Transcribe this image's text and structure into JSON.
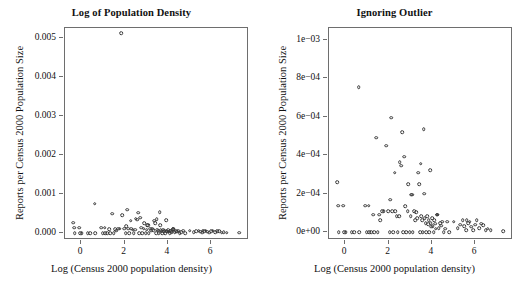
{
  "figure": {
    "shared_xlabel": "Log (Census 2000 population density)",
    "shared_ylabel": "Reports per Census 2000 Population Size",
    "point_color": "#3a3a3a",
    "axis_color": "#6e6e6e",
    "background": "#ffffff"
  },
  "chart_data": [
    {
      "type": "scatter",
      "title": "Log of Population Density",
      "xlabel": "Log (Census 2000 population density)",
      "ylabel": "Reports per Census 2000 Population Size",
      "xlim": [
        -0.75,
        7.75
      ],
      "ylim": [
        -0.00018,
        0.00525
      ],
      "xticks": [
        0,
        2,
        4,
        6
      ],
      "xticklabels": [
        "0",
        "2",
        "4",
        "6"
      ],
      "yticks": [
        0.0,
        0.001,
        0.002,
        0.003,
        0.004,
        0.005
      ],
      "yticklabels": [
        "0.000",
        "0.001",
        "0.002",
        "0.003",
        "0.004",
        "0.005"
      ],
      "grid": false,
      "legend": null,
      "marker": "open-circle",
      "n_points": 110,
      "x": [
        -0.38,
        -0.32,
        -0.3,
        -0.1,
        -0.05,
        0.02,
        0.3,
        0.42,
        0.62,
        0.65,
        0.92,
        1.0,
        1.08,
        1.12,
        1.2,
        1.28,
        1.35,
        1.42,
        1.5,
        1.58,
        1.62,
        1.7,
        1.78,
        1.85,
        1.9,
        1.98,
        2.05,
        2.08,
        2.12,
        2.18,
        2.22,
        2.28,
        2.32,
        2.38,
        2.42,
        2.48,
        2.52,
        2.58,
        2.62,
        2.68,
        2.72,
        2.78,
        2.82,
        2.88,
        2.92,
        2.98,
        3.02,
        3.05,
        3.08,
        3.12,
        3.18,
        3.22,
        3.28,
        3.32,
        3.38,
        3.42,
        3.45,
        3.48,
        3.52,
        3.55,
        3.58,
        3.62,
        3.65,
        3.68,
        3.72,
        3.75,
        3.78,
        3.82,
        3.85,
        3.88,
        3.92,
        3.95,
        3.98,
        4.02,
        4.05,
        4.08,
        4.12,
        4.15,
        4.18,
        4.22,
        4.25,
        4.28,
        4.32,
        4.38,
        4.42,
        4.48,
        4.55,
        4.62,
        4.72,
        4.8,
        5.02,
        5.2,
        5.32,
        5.42,
        5.5,
        5.58,
        5.62,
        5.68,
        5.75,
        5.82,
        5.9,
        6.0,
        6.08,
        6.18,
        6.28,
        6.38,
        6.48,
        6.58,
        6.72,
        7.3
      ],
      "y": [
        0.00026,
        0.000138,
        0.0,
        0.000138,
        0.0,
        0.0,
        0.0,
        0.0,
        0.000752,
        0.0,
        0.000138,
        0.0,
        0.000138,
        0.0,
        0.0,
        9.2e-05,
        0.0,
        0.00049,
        0.0,
        9.2e-05,
        6.2e-05,
        0.000108,
        0.000108,
        0.00511,
        0.00045,
        0.000108,
        0.0,
        0.00017,
        0.000595,
        0.000108,
        0.0,
        0.00031,
        0.000108,
        8.5e-05,
        0.0,
        8.2e-05,
        0.000365,
        0.000345,
        0.00052,
        0.0,
        0.000392,
        0.000135,
        0.0,
        0.000108,
        0.00025,
        0.0,
        8.5e-05,
        0.000195,
        0.000195,
        0.0,
        0.000108,
        6.2e-05,
        0.000105,
        7.2e-05,
        0.00031,
        0.000248,
        0.0,
        0.000355,
        8.5e-05,
        6.2e-05,
        0.0,
        0.000535,
        0.0002,
        7.2e-05,
        4.8e-05,
        0.0,
        8.5e-05,
        4.2e-05,
        6.2e-05,
        0.0,
        0.000322,
        4.8e-05,
        2.8e-05,
        7.2e-05,
        3.2e-05,
        0.0,
        6.2e-05,
        4.5e-05,
        1.8e-05,
        9.2e-05,
        9.2e-05,
        9.2e-05,
        2.2e-05,
        4.8e-05,
        3.5e-05,
        5.5e-05,
        0.0,
        1.8e-05,
        5.5e-05,
        0.0,
        5.5e-05,
        2.2e-05,
        4e-05,
        6.2e-05,
        3.2e-05,
        1.2e-05,
        6.2e-05,
        4.8e-05,
        5.5e-05,
        2.8e-05,
        1.2e-05,
        4e-05,
        6.2e-05,
        2.2e-05,
        4.5e-05,
        3.8e-05,
        1.2e-05,
        1.8e-05,
        1.2e-05,
        5e-06
      ]
    },
    {
      "type": "scatter",
      "title": "Ignoring Outlier",
      "xlabel": "Log (Census 2000 population density)",
      "ylabel": "Reports per Census 2000 Population Size",
      "xlim": [
        -0.75,
        7.75
      ],
      "ylim": [
        -4e-05,
        0.00106
      ],
      "xticks": [
        0,
        2,
        4,
        6
      ],
      "xticklabels": [
        "0",
        "2",
        "4",
        "6"
      ],
      "yticks": [
        0.0,
        0.0002,
        0.0004,
        0.0006,
        0.0008,
        0.001
      ],
      "yticklabels": [
        "0e+00",
        "2e-04",
        "4e-04",
        "6e-04",
        "8e-04",
        "1e-03"
      ],
      "grid": false,
      "legend": null,
      "marker": "open-circle",
      "note": "Same data as left panel with the single outlier at x=1.85, y=0.00511 removed.",
      "n_points": 109,
      "x": [
        -0.38,
        -0.32,
        -0.3,
        -0.1,
        -0.05,
        0.02,
        0.3,
        0.42,
        0.62,
        0.65,
        0.92,
        1.0,
        1.08,
        1.12,
        1.2,
        1.28,
        1.35,
        1.42,
        1.5,
        1.58,
        1.62,
        1.7,
        1.78,
        1.9,
        1.98,
        2.05,
        2.08,
        2.12,
        2.18,
        2.22,
        2.28,
        2.32,
        2.38,
        2.42,
        2.48,
        2.52,
        2.58,
        2.62,
        2.68,
        2.72,
        2.78,
        2.82,
        2.88,
        2.92,
        2.98,
        3.02,
        3.05,
        3.08,
        3.12,
        3.18,
        3.22,
        3.28,
        3.32,
        3.38,
        3.42,
        3.45,
        3.48,
        3.52,
        3.55,
        3.58,
        3.62,
        3.65,
        3.68,
        3.72,
        3.75,
        3.78,
        3.82,
        3.85,
        3.88,
        3.92,
        3.95,
        3.98,
        4.02,
        4.05,
        4.08,
        4.12,
        4.15,
        4.18,
        4.22,
        4.25,
        4.28,
        4.32,
        4.38,
        4.42,
        4.48,
        4.55,
        4.62,
        4.72,
        4.8,
        5.02,
        5.2,
        5.32,
        5.42,
        5.5,
        5.58,
        5.62,
        5.68,
        5.75,
        5.82,
        5.9,
        6.0,
        6.08,
        6.18,
        6.28,
        6.38,
        6.48,
        6.58,
        6.72,
        7.3
      ],
      "y": [
        0.00026,
        0.000138,
        0.0,
        0.000138,
        0.0,
        0.0,
        0.0,
        0.0,
        0.000752,
        0.0,
        0.000138,
        0.0,
        0.000138,
        0.0,
        0.0,
        9.2e-05,
        0.0,
        0.00049,
        0.0,
        9.2e-05,
        6.2e-05,
        0.000108,
        0.000108,
        0.00045,
        0.000108,
        0.0,
        0.00017,
        0.000595,
        0.000108,
        0.0,
        0.00031,
        0.000108,
        8.5e-05,
        0.0,
        8.2e-05,
        0.000365,
        0.000345,
        0.00052,
        0.0,
        0.000392,
        0.000135,
        0.0,
        0.000108,
        0.00025,
        0.0,
        8.5e-05,
        0.000195,
        0.000195,
        0.0,
        0.000108,
        6.2e-05,
        0.000105,
        7.2e-05,
        0.00031,
        0.000248,
        0.0,
        0.000355,
        8.5e-05,
        6.2e-05,
        0.0,
        0.000535,
        0.0002,
        7.2e-05,
        4.8e-05,
        0.0,
        8.5e-05,
        4.2e-05,
        6.2e-05,
        0.0,
        0.000322,
        4.8e-05,
        2.8e-05,
        7.2e-05,
        3.2e-05,
        0.0,
        6.2e-05,
        4.5e-05,
        1.8e-05,
        9.2e-05,
        9.2e-05,
        9.2e-05,
        2.2e-05,
        4.8e-05,
        3.5e-05,
        5.5e-05,
        0.0,
        1.8e-05,
        5.5e-05,
        0.0,
        5.5e-05,
        2.2e-05,
        4e-05,
        6.2e-05,
        3.2e-05,
        1.2e-05,
        6.2e-05,
        4.8e-05,
        5.5e-05,
        2.8e-05,
        1.2e-05,
        4e-05,
        6.2e-05,
        2.2e-05,
        4.5e-05,
        3.8e-05,
        1.2e-05,
        1.8e-05,
        1.2e-05,
        5e-06
      ]
    }
  ]
}
